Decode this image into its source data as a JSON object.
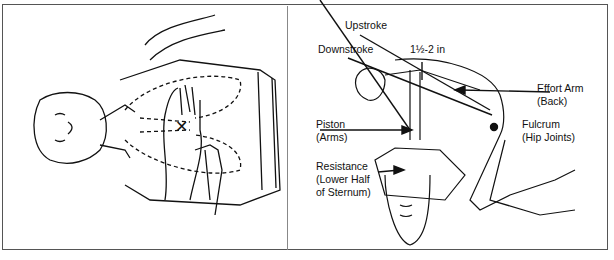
{
  "figure": {
    "left_panel": {
      "description": "Hand placement on lower half of sternum",
      "marker": "✕"
    },
    "right_panel": {
      "description": "Body mechanics of chest compression (lever system)",
      "labels": {
        "upstroke": "Upstroke",
        "downstroke": "Downstroke",
        "depth": "1½-2 in",
        "effort_arm": [
          "Effort Arm",
          "(Back)"
        ],
        "piston": [
          "Piston",
          "(Arms)"
        ],
        "fulcrum": [
          "Fulcrum",
          "(Hip Joints)"
        ],
        "resistance": [
          "Resistance",
          "(Lower Half",
          "of Sternum)"
        ]
      }
    }
  }
}
